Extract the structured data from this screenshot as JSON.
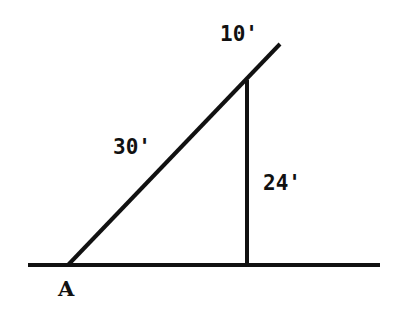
{
  "diagram": {
    "labels": {
      "top_segment": "10'",
      "hypotenuse": "30'",
      "vertical": "24'",
      "point": "A"
    },
    "colors": {
      "line": "#111111",
      "background": "#ffffff"
    }
  }
}
